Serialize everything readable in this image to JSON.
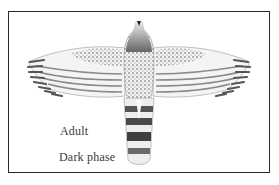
{
  "illustration": {
    "subject": "hawk-in-flight-ventral-view",
    "labels": {
      "age": "Adult",
      "phase": "Dark phase"
    },
    "colors": {
      "border": "#2a2a2a",
      "ink": "#3a3a3a",
      "background": "#ffffff"
    }
  }
}
